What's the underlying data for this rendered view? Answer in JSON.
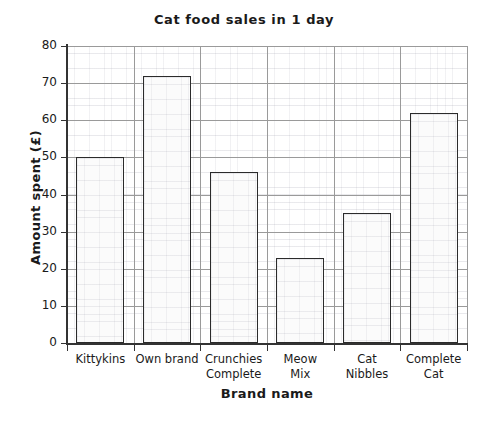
{
  "chart_data": {
    "type": "bar",
    "title": "Cat food sales in 1 day",
    "xlabel": "Brand name",
    "ylabel": "Amount spent (£)",
    "categories": [
      "Kittykins",
      "Own brand",
      "Crunchies Complete",
      "Meow Mix",
      "Cat Nibbles",
      "Complete Cat"
    ],
    "category_lines": [
      [
        "Kittykins",
        ""
      ],
      [
        "Own brand",
        ""
      ],
      [
        "Crunchies",
        "Complete"
      ],
      [
        "Meow",
        "Mix"
      ],
      [
        "Cat",
        "Nibbles"
      ],
      [
        "Complete",
        "Cat"
      ]
    ],
    "values": [
      50,
      72,
      46,
      23,
      35,
      62
    ],
    "ylim": [
      0,
      80
    ],
    "ytick_labels": [
      "0",
      "10",
      "20",
      "30",
      "40",
      "50",
      "60",
      "70",
      "80"
    ],
    "ytick_values": [
      0,
      10,
      20,
      30,
      40,
      50,
      60,
      70,
      80
    ],
    "grid": true,
    "minor_grid": true,
    "legend": "none",
    "bar_fill_color": "#fbfbfb",
    "bar_edge_color": "#2b2b2b",
    "axis_color": "#333333",
    "grid_color": "#9a9a9a",
    "background_color": "#ffffff"
  }
}
